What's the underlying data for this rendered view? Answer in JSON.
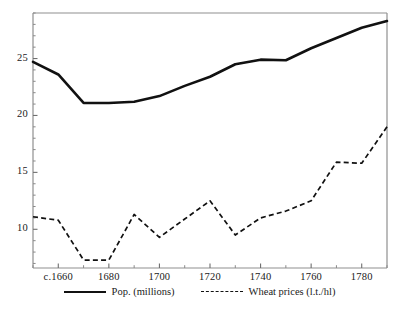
{
  "chart_data": {
    "type": "line",
    "title": "",
    "subtitle": "",
    "xlabel": "",
    "ylabel": "",
    "xlim": [
      1650,
      1790
    ],
    "ylim": [
      6.6,
      29.0
    ],
    "grid": false,
    "legend_position": "bottom-center",
    "x_tick_labels": [
      "c.1660",
      "1680",
      "1700",
      "1720",
      "1740",
      "1760",
      "1780"
    ],
    "x_tick_values": [
      1660,
      1680,
      1700,
      1720,
      1740,
      1760,
      1780
    ],
    "x_minor_ticks": [
      1650,
      1670,
      1690,
      1710,
      1730,
      1750,
      1770,
      1790
    ],
    "y_tick_labels": [
      "10",
      "15",
      "20",
      "25"
    ],
    "y_tick_values": [
      10,
      15,
      20,
      25
    ],
    "x": [
      1650,
      1660,
      1670,
      1680,
      1690,
      1700,
      1710,
      1720,
      1730,
      1740,
      1750,
      1760,
      1770,
      1780,
      1790
    ],
    "series": [
      {
        "name": "Pop. (millions)",
        "style": "solid",
        "color": "#111111",
        "values": [
          24.7,
          23.6,
          21.1,
          21.1,
          21.2,
          21.7,
          22.6,
          23.4,
          24.5,
          24.9,
          24.85,
          25.9,
          26.8,
          27.7,
          28.3
        ]
      },
      {
        "name": "Wheat prices (l.t./hl)",
        "style": "dashed",
        "color": "#111111",
        "values": [
          11.1,
          10.8,
          7.3,
          7.3,
          11.3,
          9.3,
          10.9,
          12.5,
          9.5,
          11.0,
          11.6,
          12.5,
          15.9,
          15.8,
          19.0
        ]
      }
    ]
  },
  "legend": {
    "entries": [
      {
        "label": "Pop. (millions)",
        "style": "solid"
      },
      {
        "label": "Wheat prices (l.t./hl)",
        "style": "dashed"
      }
    ]
  },
  "axis": {
    "y_labels": [
      "25",
      "20",
      "15",
      "10"
    ],
    "x_labels": [
      "c.1660",
      "1680",
      "1700",
      "1720",
      "1740",
      "1760",
      "1780"
    ]
  }
}
